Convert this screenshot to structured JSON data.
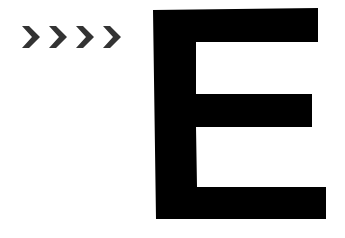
{
  "graphic": {
    "chevrons": {
      "count": 4,
      "glyph": ">",
      "icon": "chevron-right-icon",
      "color": "#333333"
    },
    "letter": {
      "text": "E",
      "color": "#000000"
    },
    "background": "#ffffff"
  }
}
